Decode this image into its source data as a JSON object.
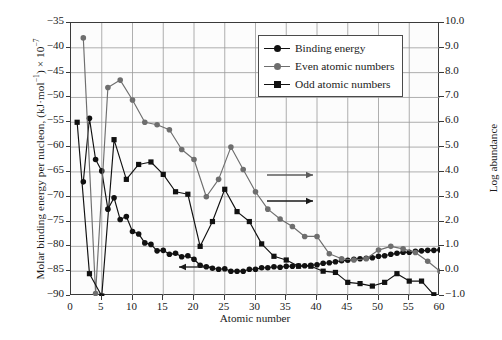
{
  "chart_data": {
    "type": "line",
    "title": "",
    "xlabel": "Atomic number",
    "ylabel_left": "Molar binding energy per nucleon, (kJ·mol⁻¹) × 10⁻⁷",
    "ylabel_right": "Log abundance",
    "xlim": [
      0,
      60
    ],
    "ylim_left": [
      -90,
      -35
    ],
    "ylim_right": [
      -1.0,
      10.0
    ],
    "xticks": [
      0,
      5,
      10,
      15,
      20,
      25,
      30,
      35,
      40,
      45,
      50,
      55,
      60
    ],
    "yticks_left": [
      -35,
      -40,
      -45,
      -50,
      -55,
      -60,
      -65,
      -70,
      -75,
      -80,
      -85,
      -90
    ],
    "yticks_right": [
      10.0,
      9.0,
      8.0,
      7.0,
      6.0,
      5.0,
      4.0,
      3.0,
      2.0,
      1.0,
      0.0,
      -1.0
    ],
    "grid": true,
    "legend_position": "top-right",
    "annotations": [
      {
        "name": "left-arrow-binding-energy",
        "direction": "left",
        "points_to": "left-axis"
      },
      {
        "name": "right-arrow-even",
        "direction": "right",
        "points_to": "right-axis"
      },
      {
        "name": "right-arrow-odd",
        "direction": "right",
        "points_to": "right-axis"
      }
    ],
    "series": [
      {
        "name": "Binding energy",
        "axis": "left",
        "color": "#111111",
        "marker": "circle",
        "x": [
          2,
          3,
          4,
          5,
          6,
          7,
          8,
          9,
          10,
          11,
          12,
          13,
          14,
          15,
          16,
          17,
          18,
          19,
          20,
          21,
          22,
          23,
          24,
          25,
          26,
          27,
          28,
          29,
          30,
          31,
          32,
          33,
          34,
          35,
          36,
          37,
          38,
          39,
          40,
          41,
          42,
          43,
          44,
          45,
          46,
          47,
          48,
          49,
          50,
          51,
          52,
          53,
          54,
          55,
          56,
          57,
          58,
          59,
          60
        ],
        "y": [
          -67.0,
          -54.2,
          -62.5,
          -64.8,
          -72.5,
          -70.2,
          -74.6,
          -74.0,
          -77.0,
          -77.5,
          -79.3,
          -79.6,
          -80.9,
          -80.8,
          -81.6,
          -81.4,
          -82.1,
          -81.9,
          -82.6,
          -83.8,
          -84.1,
          -84.4,
          -84.6,
          -84.5,
          -85.0,
          -85.0,
          -85.0,
          -84.6,
          -84.6,
          -84.3,
          -84.3,
          -84.1,
          -84.2,
          -84.0,
          -84.0,
          -83.9,
          -83.9,
          -83.8,
          -83.7,
          -83.4,
          -83.3,
          -83.1,
          -82.9,
          -82.8,
          -82.6,
          -82.5,
          -82.4,
          -82.3,
          -82.0,
          -81.9,
          -81.6,
          -81.4,
          -81.2,
          -81.2,
          -81.0,
          -80.9,
          -80.8,
          -80.8,
          -80.7
        ]
      },
      {
        "name": "Even atomic numbers",
        "axis": "right",
        "color": "#6e6e6e",
        "marker": "circle",
        "x": [
          2,
          4,
          6,
          8,
          10,
          12,
          14,
          16,
          18,
          20,
          22,
          24,
          26,
          28,
          30,
          32,
          34,
          36,
          38,
          40,
          42,
          44,
          46,
          48,
          50,
          52,
          54,
          56,
          58,
          60
        ],
        "y": [
          9.4,
          -0.9,
          7.4,
          7.7,
          6.9,
          6.0,
          5.9,
          5.7,
          4.9,
          4.5,
          3.0,
          3.7,
          5.0,
          4.1,
          3.2,
          2.5,
          2.1,
          1.8,
          1.4,
          1.4,
          0.7,
          0.5,
          0.45,
          0.5,
          0.85,
          1.0,
          0.9,
          0.75,
          0.4,
          0.0
        ]
      },
      {
        "name": "Odd atomic numbers",
        "axis": "right",
        "color": "#111111",
        "marker": "square",
        "x": [
          1,
          3,
          5,
          7,
          9,
          11,
          13,
          15,
          17,
          19,
          21,
          23,
          25,
          27,
          29,
          31,
          33,
          35,
          37,
          39,
          41,
          43,
          45,
          47,
          49,
          51,
          53,
          55,
          57,
          59
        ],
        "y": [
          6.0,
          -0.1,
          -1.0,
          5.3,
          3.7,
          4.3,
          4.4,
          3.9,
          3.2,
          3.1,
          1.0,
          2.0,
          3.3,
          2.4,
          2.0,
          1.1,
          0.6,
          0.45,
          0.2,
          0.2,
          0.0,
          -0.05,
          -0.45,
          -0.5,
          -0.6,
          -0.45,
          -0.1,
          -0.4,
          -0.4,
          -0.95
        ]
      }
    ]
  },
  "legend": {
    "items": [
      {
        "label": "Binding energy",
        "marker": "circle",
        "color": "#111111"
      },
      {
        "label": "Even atomic numbers",
        "marker": "circle",
        "color": "#6e6e6e"
      },
      {
        "label": "Odd atomic numbers",
        "marker": "square",
        "color": "#111111"
      }
    ]
  },
  "axes": {
    "left_title_main": "Molar binding energy per nucleon, (kJ",
    "left_title_unit": "mol",
    "left_title_exp1": "−1",
    "left_title_tail": ") × 10",
    "left_title_exp2": "−7",
    "right_title": "Log abundance",
    "bottom_title": "Atomic number"
  }
}
